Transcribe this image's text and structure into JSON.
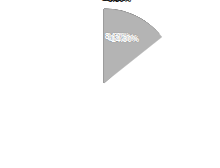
{
  "chart_data": {
    "type": "pie",
    "title": "",
    "subtitle": "",
    "xlabel": "",
    "ylabel": "",
    "legend_position": "none",
    "grid": false,
    "start_angle_deg": 0,
    "direction": "clockwise",
    "value_unit": "%",
    "total": 100.0,
    "categories": [
      "Segment 1",
      "Segment 2",
      "Segment 3",
      "Segment 4",
      "Segment 5",
      "Segment 6",
      "Segment 7",
      "Segment 8",
      "Segment 9",
      "Segment 10",
      "Segment 11"
    ],
    "values": [
      12.4,
      11.2,
      3.4,
      9.3,
      3.9,
      13.4,
      8.1,
      5.0,
      5.8,
      13.2,
      14.3
    ],
    "labels": [
      "12.40%",
      "11.20%",
      "3.40%",
      "9.30%",
      "3.90%",
      "13.40%",
      "8.10%",
      "5.00%",
      "5.80%",
      "13.20%",
      "14.30%"
    ],
    "colors": [
      "#4a4a4a",
      "#3c3c3c",
      "#a8a8a8",
      "#555555",
      "#7a7a7a",
      "#6e6e6e",
      "#8f8f8f",
      "#828282",
      "#d2d2d2",
      "#8a8a8a",
      "#b4b4b4"
    ],
    "label_placement": [
      "inside",
      "inside",
      "outside",
      "inside",
      "outside",
      "inside",
      "inside",
      "outside",
      "outside",
      "inside",
      "inside"
    ]
  },
  "geometry": {
    "center_x": 104,
    "center_y": 83,
    "radius": 74
  },
  "background_color": "#ffffff",
  "label_inside_color": "#ffffff",
  "label_outside_color": "#1a1a1a"
}
